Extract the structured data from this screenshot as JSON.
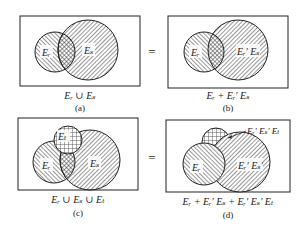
{
  "colors": {
    "ink": "#222222",
    "background": "#ffffff"
  },
  "equals_sign": "=",
  "panels": [
    {
      "id": "a",
      "caption": "Eᵣ ∪ Eₛ",
      "sub_label": "(a)",
      "regions": [
        {
          "label": "Eᵣ"
        },
        {
          "label": "Eₛ"
        }
      ]
    },
    {
      "id": "b",
      "caption": "Eᵣ + Eᵣ′ Eₛ",
      "sub_label": "(b)",
      "regions": [
        {
          "label": "Eᵣ"
        },
        {
          "label": "Eᵣ′ Eₛ"
        }
      ]
    },
    {
      "id": "c",
      "caption": "Eᵣ ∪ Eₛ ∪ Eₜ",
      "sub_label": "(c)",
      "regions": [
        {
          "label": "Eₜ"
        },
        {
          "label": "Eᵣ"
        },
        {
          "label": "Eₛ"
        }
      ]
    },
    {
      "id": "d",
      "caption": "Eᵣ + Eᵣ′ Eₛ + Eᵣ′ Eₛ′ Eₜ",
      "sub_label": "(d)",
      "regions": [
        {
          "label": "Eᵣ"
        },
        {
          "label": "Eᵣ′ Eₛ′"
        }
      ],
      "callout": "Eᵣ′ Eₛ′ Eₜ"
    }
  ]
}
